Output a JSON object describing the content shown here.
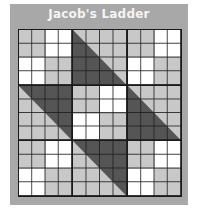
{
  "title": "Jacob's Ladder",
  "colors": {
    "frame": "#a8a8a8",
    "dark": "#555555",
    "light": "#c8c8c8",
    "white": "#ffffff",
    "lines": "#1a1a1a"
  },
  "layout": {
    "rows": 3,
    "cols": 3,
    "cells_per_block": 4
  },
  "blocks": [
    {
      "type": "four-patch",
      "pattern": "light-white/white-light"
    },
    {
      "type": "half-square-triangle",
      "dark": "lower-left",
      "light": "upper-right"
    },
    {
      "type": "four-patch",
      "pattern": "light-white/white-light"
    },
    {
      "type": "half-square-triangle",
      "dark": "upper-right",
      "light": "lower-left"
    },
    {
      "type": "four-patch",
      "pattern": "light-white/white-light"
    },
    {
      "type": "half-square-triangle",
      "dark": "lower-left",
      "light": "upper-right"
    },
    {
      "type": "four-patch",
      "pattern": "light-white/white-light"
    },
    {
      "type": "half-square-triangle",
      "dark": "upper-right",
      "light": "lower-left"
    },
    {
      "type": "four-patch",
      "pattern": "light-white/white-light"
    }
  ]
}
